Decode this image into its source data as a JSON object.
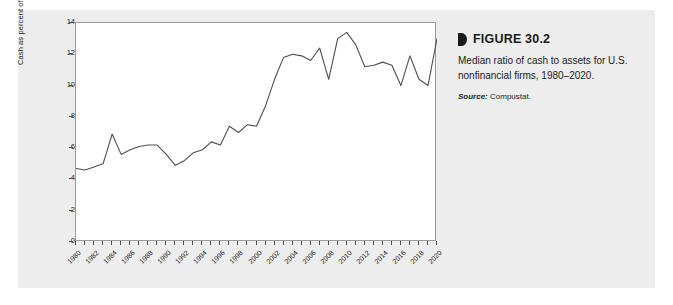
{
  "caption": {
    "marker_icon": "triangle-marker-icon",
    "title": "FIGURE 30.2",
    "description": "Median ratio of cash to assets for U.S. nonfinancial firms, 1980–2020.",
    "source_label": "Source:",
    "source_value": "Compustat."
  },
  "chart_data": {
    "type": "line",
    "title": "",
    "xlabel": "",
    "ylabel": "Cash as percent of assets",
    "ylim": [
      0,
      14
    ],
    "xlim": [
      1980,
      2020
    ],
    "ytick_values": [
      0,
      2,
      4,
      6,
      8,
      10,
      12,
      14
    ],
    "ytick_labels": [
      "0",
      "2",
      "4",
      "6",
      "8",
      "10",
      "12",
      "14"
    ],
    "xtick_labels": [
      "1980",
      "1982",
      "1984",
      "1986",
      "1988",
      "1990",
      "1992",
      "1994",
      "1996",
      "1998",
      "2000",
      "2002",
      "2004",
      "2006",
      "2008",
      "2010",
      "2012",
      "2014",
      "2016",
      "2018",
      "2020"
    ],
    "xtick_label_step": 2,
    "minor_tick_step": 1,
    "grid": false,
    "legend": false,
    "line_color": "#4d4d4d",
    "x": [
      1980,
      1981,
      1982,
      1983,
      1984,
      1985,
      1986,
      1987,
      1988,
      1989,
      1990,
      1991,
      1992,
      1993,
      1994,
      1995,
      1996,
      1997,
      1998,
      1999,
      2000,
      2001,
      2002,
      2003,
      2004,
      2005,
      2006,
      2007,
      2008,
      2009,
      2010,
      2011,
      2012,
      2013,
      2014,
      2015,
      2016,
      2017,
      2018,
      2019,
      2020
    ],
    "values": [
      4.7,
      4.6,
      4.8,
      5.0,
      6.9,
      5.6,
      5.9,
      6.1,
      6.2,
      6.2,
      5.6,
      4.9,
      5.2,
      5.7,
      5.9,
      6.4,
      6.2,
      7.4,
      7.0,
      7.5,
      7.4,
      8.7,
      10.4,
      11.8,
      12.0,
      11.9,
      11.6,
      12.4,
      10.4,
      13.0,
      13.4,
      12.6,
      11.2,
      11.3,
      11.5,
      11.3,
      10.0,
      11.9,
      10.4,
      10.0,
      13.0
    ]
  }
}
